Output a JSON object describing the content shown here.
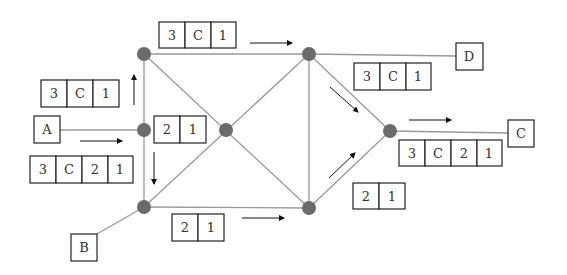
{
  "colors": {
    "node": "#6b6b6b",
    "edge": "#9a9a9a",
    "box": "#222222",
    "arrow": "#111111",
    "text": "#333333"
  },
  "endpoints": [
    {
      "id": "A",
      "label": "A"
    },
    {
      "id": "B",
      "label": "B"
    },
    {
      "id": "C",
      "label": "C"
    },
    {
      "id": "D",
      "label": "D"
    }
  ],
  "packets": [
    {
      "id": "top",
      "cells": [
        "3",
        "C",
        "1"
      ]
    },
    {
      "id": "left-upper",
      "cells": [
        "3",
        "C",
        "1"
      ]
    },
    {
      "id": "center",
      "cells": [
        "2",
        "1"
      ]
    },
    {
      "id": "left-lower",
      "cells": [
        "3",
        "C",
        "2",
        "1"
      ]
    },
    {
      "id": "bottom",
      "cells": [
        "2",
        "1"
      ]
    },
    {
      "id": "right-upper",
      "cells": [
        "3",
        "C",
        "1"
      ]
    },
    {
      "id": "right-lower",
      "cells": [
        "3",
        "C",
        "2",
        "1"
      ]
    },
    {
      "id": "right-bottom",
      "cells": [
        "2",
        "1"
      ]
    }
  ]
}
